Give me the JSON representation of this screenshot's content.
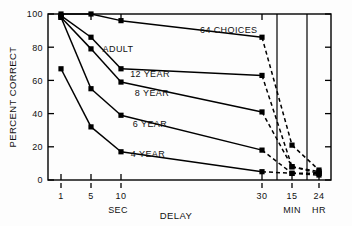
{
  "chart_data": {
    "type": "line",
    "title": "",
    "annotation": "64 CHOICES",
    "xlabel": "DELAY",
    "ylabel": "PERCENT CORRECT",
    "ylim": [
      0,
      100
    ],
    "yticks": [
      0,
      20,
      40,
      60,
      80,
      100
    ],
    "ytick_labels": [
      "0",
      "20",
      "40",
      "60",
      "80",
      "100"
    ],
    "x": [
      "1",
      "5",
      "10",
      "30",
      "15",
      "24"
    ],
    "xtick_labels": [
      "1",
      "5",
      "10",
      "30",
      "15",
      "24"
    ],
    "x_unit_groups": [
      {
        "label": "SEC",
        "ticks": [
          "1",
          "5",
          "10",
          "30"
        ]
      },
      {
        "label": "MIN",
        "ticks": [
          "15"
        ]
      },
      {
        "label": "HR",
        "ticks": [
          "24"
        ]
      }
    ],
    "grid": false,
    "legend_position": "inline-labels",
    "series": [
      {
        "name": "ADULT",
        "label": "ADULT",
        "values": [
          100,
          100,
          96,
          86,
          21,
          6
        ],
        "dashed_from_index": 3
      },
      {
        "name": "12 YEAR",
        "label": "12 YEAR",
        "values": [
          99,
          86,
          67,
          63,
          8,
          5
        ],
        "dashed_from_index": 3
      },
      {
        "name": "8 YEAR",
        "label": "8 YEAR",
        "values": [
          98,
          79,
          59,
          41,
          8,
          4
        ],
        "dashed_from_index": 3
      },
      {
        "name": "6 YEAR",
        "label": "6 YEAR",
        "values": [
          98,
          55,
          39,
          18,
          4,
          4
        ],
        "dashed_from_index": 3
      },
      {
        "name": "4 YEAR",
        "label": "4 YEAR",
        "values": [
          67,
          32,
          17,
          5,
          4,
          3
        ],
        "dashed_from_index": 3
      }
    ],
    "series_label_positions": [
      {
        "name": "ADULT",
        "x": 118,
        "y": 52
      },
      {
        "name": "12 YEAR",
        "x": 150,
        "y": 77
      },
      {
        "name": "8 YEAR",
        "x": 152,
        "y": 96
      },
      {
        "name": "6 YEAR",
        "x": 150,
        "y": 127
      },
      {
        "name": "4 YEAR",
        "x": 148,
        "y": 157
      }
    ],
    "colors": {
      "line": "#000000",
      "marker": "#000000",
      "axis": "#000000",
      "background": "#ffffff"
    }
  }
}
